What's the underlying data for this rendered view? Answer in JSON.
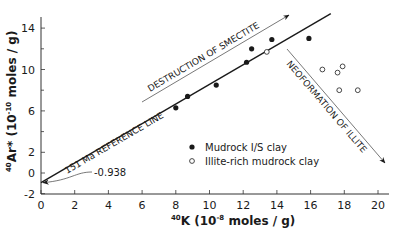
{
  "chart_data": {
    "type": "scatter",
    "title": "",
    "xlabel": "40K (10^-8 moles/g)",
    "ylabel": "40Ar* (10^-10 moles/g)",
    "xlabel_parts": {
      "sup": "40",
      "main": "K (10",
      "exp": "-8",
      "tail": " moles / g)"
    },
    "ylabel_parts": {
      "sup": "40",
      "main": "Ar* (10",
      "exp": "-10",
      "tail": " moles / g)"
    },
    "xlim": [
      0,
      20
    ],
    "ylim": [
      -2,
      15
    ],
    "xticks": [
      0,
      2,
      4,
      6,
      8,
      10,
      12,
      14,
      16,
      18,
      20
    ],
    "yticks": [
      -2,
      0,
      2,
      6,
      10,
      14
    ],
    "yticks_minor": [
      4,
      8,
      12
    ],
    "grid": false,
    "legend_position": "center-right inside",
    "series": [
      {
        "name": "Mudrock I/S clay",
        "marker": "filled-circle",
        "points": [
          [
            8.0,
            6.3
          ],
          [
            8.7,
            7.4
          ],
          [
            10.4,
            8.5
          ],
          [
            12.2,
            10.7
          ],
          [
            12.5,
            12.0
          ],
          [
            13.7,
            12.9
          ],
          [
            15.9,
            13.0
          ]
        ]
      },
      {
        "name": "Illite-rich mudrock clay",
        "marker": "open-circle",
        "points": [
          [
            13.4,
            11.7
          ],
          [
            16.7,
            10.0
          ],
          [
            17.6,
            9.7
          ],
          [
            17.9,
            10.3
          ],
          [
            17.7,
            8.0
          ],
          [
            18.8,
            8.0
          ]
        ]
      }
    ],
    "reference_line": {
      "label": "151 Ma REFERENCE LINE",
      "intercept": -0.938,
      "x_start": 0,
      "y_start": -0.938,
      "x_end": 17.2,
      "y_end": 15.4
    },
    "annotations": [
      {
        "text": "DESTRUCTION OF SMECTITE",
        "type": "arrow",
        "direction": "up-right"
      },
      {
        "text": "NEOFORMATION OF ILLITE",
        "type": "arrow",
        "direction": "down-right"
      },
      {
        "text": "-0.938",
        "type": "callout-arrow",
        "target": [
          0,
          -0.938
        ]
      }
    ]
  }
}
